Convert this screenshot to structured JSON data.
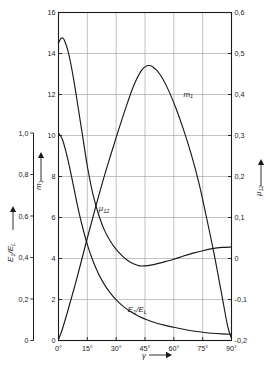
{
  "chart_data": {
    "type": "line",
    "title": "",
    "xlabel": "γ",
    "x_tick_labels": [
      "0°",
      "15°",
      "30°",
      "45°",
      "60°",
      "75°",
      "90°"
    ],
    "x_ticks": [
      0,
      15,
      30,
      45,
      60,
      75,
      90
    ],
    "xlim": [
      0,
      90
    ],
    "grid": true,
    "legend": "inline-curve-labels",
    "axes": [
      {
        "id": "left-outer",
        "label": "E",
        "label_sub": "1",
        "label_tail": "/E",
        "label_tail_sub": "L",
        "label_full": "E₁/E_L",
        "position": "left-outer",
        "lim": [
          0,
          1.0
        ],
        "ticks": [
          0,
          0.2,
          0.4,
          0.6,
          0.8,
          1.0
        ],
        "tick_labels": [
          "0",
          "0,2",
          "0,4",
          "0,6",
          "0,8",
          "1,0"
        ],
        "arrow": "up"
      },
      {
        "id": "left-inner",
        "label": "m",
        "label_sub": "1",
        "label_full": "m₁",
        "position": "left-inner",
        "lim": [
          0,
          16
        ],
        "ticks": [
          0,
          2,
          4,
          6,
          8,
          10,
          12,
          14,
          16
        ],
        "tick_labels": [
          "0",
          "2",
          "4",
          "6",
          "8",
          "10",
          "12",
          "14",
          "16"
        ],
        "arrow": "up"
      },
      {
        "id": "right",
        "label": "μ",
        "label_sub": "12",
        "label_full": "μ₁₂",
        "position": "right",
        "lim": [
          -0.2,
          0.6
        ],
        "ticks": [
          -0.2,
          -0.1,
          0,
          0.1,
          0.2,
          0.3,
          0.4,
          0.5,
          0.6
        ],
        "tick_labels": [
          "-0,2",
          "-0,1",
          "0",
          "0,1",
          "0,2",
          "0,3",
          "0,4",
          "0,5",
          "0,6"
        ],
        "arrow": "up"
      }
    ],
    "series": [
      {
        "name": "m₁",
        "label": "m",
        "label_sub": "1",
        "axis": "left-inner",
        "color": "#1a1a1a",
        "label_x": 65,
        "label_y": 11.9,
        "x": [
          0,
          2,
          5,
          8,
          11,
          15,
          19,
          23,
          27,
          31,
          35,
          39,
          43,
          46,
          49,
          53,
          57,
          61,
          65,
          69,
          73,
          77,
          81,
          85,
          88,
          90
        ],
        "values": [
          0.05,
          0.55,
          1.5,
          2.5,
          3.55,
          5.0,
          6.4,
          7.75,
          9.0,
          10.2,
          11.35,
          12.4,
          13.15,
          13.4,
          13.35,
          12.95,
          12.25,
          11.35,
          10.3,
          9.1,
          7.7,
          6.0,
          4.2,
          2.2,
          0.7,
          0.1
        ]
      },
      {
        "name": "μ₁₂",
        "label": "μ",
        "label_sub": "12",
        "axis": "right",
        "color": "#1a1a1a",
        "label_x": 21,
        "label_y": 0.115,
        "x": [
          0,
          1,
          2,
          3,
          5,
          7,
          9,
          11,
          13,
          15,
          18,
          21,
          24,
          27,
          30,
          33,
          36,
          39,
          42,
          45,
          48,
          52,
          56,
          60,
          65,
          70,
          75,
          80,
          85,
          90
        ],
        "values": [
          0.525,
          0.535,
          0.538,
          0.533,
          0.505,
          0.46,
          0.405,
          0.345,
          0.285,
          0.225,
          0.155,
          0.105,
          0.068,
          0.042,
          0.022,
          0.007,
          -0.005,
          -0.013,
          -0.018,
          -0.018,
          -0.016,
          -0.012,
          -0.007,
          -0.002,
          0.006,
          0.013,
          0.019,
          0.024,
          0.027,
          0.028
        ]
      },
      {
        "name": "E₁/E_L",
        "label": "E",
        "label_sub": "1",
        "label_tail": "/E",
        "label_tail_sub": "L",
        "axis": "left-outer",
        "color": "#1a1a1a",
        "label_x": 36,
        "label_y": 0.135,
        "x": [
          0,
          2,
          4,
          6,
          8,
          10,
          12,
          15,
          18,
          21,
          24,
          27,
          30,
          34,
          38,
          42,
          46,
          50,
          55,
          60,
          65,
          70,
          75,
          80,
          85,
          90
        ],
        "values": [
          1.0,
          0.97,
          0.905,
          0.825,
          0.735,
          0.645,
          0.565,
          0.462,
          0.382,
          0.318,
          0.268,
          0.228,
          0.196,
          0.162,
          0.136,
          0.116,
          0.1,
          0.087,
          0.074,
          0.064,
          0.054,
          0.046,
          0.04,
          0.035,
          0.032,
          0.03
        ]
      }
    ]
  }
}
